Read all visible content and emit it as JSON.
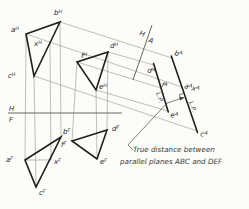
{
  "figure": {
    "caption": {
      "line1": "True distance between",
      "line2": "parallel planes ABC and DEF"
    },
    "fold_hf": {
      "above": "H",
      "below": "F"
    },
    "fold_ha": {
      "left": "H",
      "right": "A"
    },
    "edge_label": "L.P.",
    "points": {
      "aH": {
        "base": "a",
        "sup": "H"
      },
      "bH": {
        "base": "b",
        "sup": "H"
      },
      "cH": {
        "base": "c",
        "sup": "H"
      },
      "xH": {
        "base": "x",
        "sup": "H"
      },
      "dH": {
        "base": "d",
        "sup": "H"
      },
      "eH": {
        "base": "e",
        "sup": "H"
      },
      "fH": {
        "base": "f",
        "sup": "H"
      },
      "aF": {
        "base": "a",
        "sup": "F"
      },
      "bF": {
        "base": "b",
        "sup": "F"
      },
      "cF": {
        "base": "c",
        "sup": "F"
      },
      "xF": {
        "base": "x",
        "sup": "F"
      },
      "dF": {
        "base": "d",
        "sup": "F"
      },
      "eF": {
        "base": "e",
        "sup": "F"
      },
      "fF": {
        "base": "f",
        "sup": "F"
      },
      "bA": {
        "base": "b",
        "sup": "A"
      },
      "cA": {
        "base": "c",
        "sup": "A"
      },
      "dA": {
        "base": "d",
        "sup": "A"
      },
      "eA": {
        "base": "e",
        "sup": "A"
      },
      "fA": {
        "base": "f",
        "sup": "A"
      },
      "aAxA": {
        "b1": "a",
        "s1": "A",
        "b2": "x",
        "s2": "A"
      }
    }
  }
}
